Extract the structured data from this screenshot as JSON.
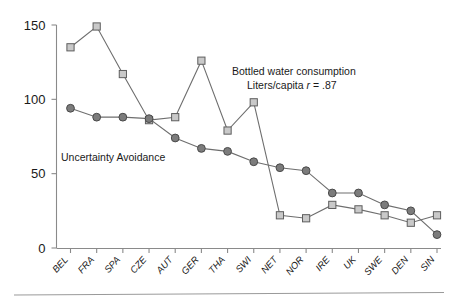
{
  "chart_data": {
    "type": "line",
    "title": "",
    "xlabel": "",
    "ylabel": "",
    "ylim": [
      0,
      150
    ],
    "yticks": [
      0,
      50,
      100,
      150
    ],
    "ytick_labels": [
      "0",
      "50",
      "100",
      "150"
    ],
    "grid": false,
    "legend_position": "inline-annotation",
    "categories": [
      "BEL",
      "FRA",
      "SPA",
      "CZE",
      "AUT",
      "GER",
      "THA",
      "SWI",
      "NET",
      "NOR",
      "IRE",
      "UK",
      "SWE",
      "DEN",
      "SIN"
    ],
    "series": [
      {
        "name": "Bottled water consumption Liters/capita",
        "marker": "square",
        "color": "#c9c9c9",
        "values": [
          135,
          149,
          117,
          86,
          88,
          126,
          79,
          98,
          22,
          20,
          29,
          26,
          22,
          17,
          22
        ]
      },
      {
        "name": "Uncertainty Avoidance",
        "marker": "circle",
        "color": "#7c7c7c",
        "values": [
          94,
          88,
          88,
          87,
          74,
          67,
          65,
          58,
          54,
          52,
          37,
          37,
          29,
          25,
          9
        ]
      }
    ],
    "annotations": [
      {
        "id": "bottled-water-annotation",
        "line1": "Bottled water consumption",
        "line2": "Liters/capita ",
        "stat_symbol": "r",
        "stat_value": " = .87",
        "x": 232,
        "y": 75
      },
      {
        "id": "uncertainty-avoidance-annotation",
        "line1": "Uncertainty Avoidance",
        "x": 61,
        "y": 161
      }
    ]
  }
}
